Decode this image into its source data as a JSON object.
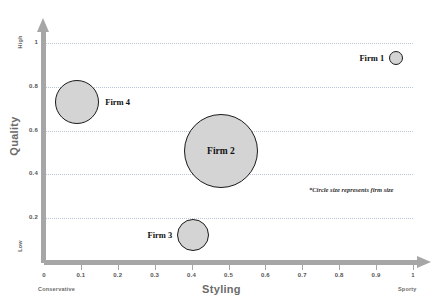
{
  "chart_data": {
    "type": "scatter",
    "title": "",
    "xlabel": "Styling",
    "ylabel": "Quality",
    "xlim": [
      0,
      1
    ],
    "ylim": [
      0,
      1
    ],
    "grid": true,
    "legend": "none",
    "x_ticks": [
      "0",
      "0.1",
      "0.2",
      "0.3",
      "0.4",
      "0.5",
      "0.6",
      "0.7",
      "0.8",
      "0.9",
      "1"
    ],
    "y_ticks": [
      "0.2",
      "0.4",
      "0.6",
      "0.8",
      "1"
    ],
    "x_axis_low_label": "Conservative",
    "x_axis_high_label": "Sporty",
    "y_axis_low_label": "Low",
    "y_axis_high_label": "High",
    "annotation": "*Circle size represents firm size",
    "points": [
      {
        "label": "Firm 1",
        "x": 0.955,
        "y": 0.93,
        "size": 7,
        "label_position": "left"
      },
      {
        "label": "Firm 2",
        "x": 0.48,
        "y": 0.505,
        "size": 37,
        "label_position": "inside"
      },
      {
        "label": "Firm 3",
        "x": 0.405,
        "y": 0.125,
        "size": 16,
        "label_position": "left"
      },
      {
        "label": "Firm 4",
        "x": 0.09,
        "y": 0.73,
        "size": 22,
        "label_position": "right"
      }
    ]
  },
  "colors": {
    "bubble_fill": "#d4d4d4",
    "bubble_stroke": "#1a1a1a",
    "axis": "#a6a6a6",
    "gridline": "#b9c4d6",
    "label_text": "#6b6b6b"
  }
}
